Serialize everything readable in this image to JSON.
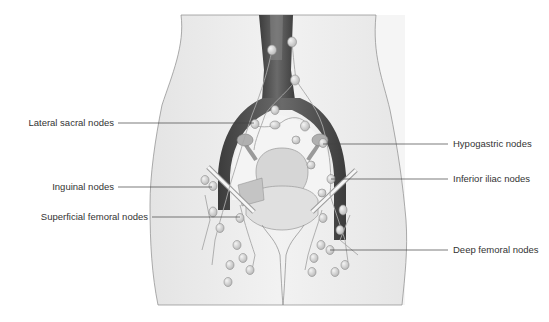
{
  "figure": {
    "labels_left": [
      {
        "id": "lateral-sacral",
        "text": "Lateral sacral nodes",
        "y": 123
      },
      {
        "id": "inguinal",
        "text": "Inguinal nodes",
        "y": 187
      },
      {
        "id": "superficial-femoral",
        "text": "Superficial femoral nodes",
        "y": 217
      }
    ],
    "labels_right": [
      {
        "id": "hypogastric",
        "text": "Hypogastric nodes",
        "y": 144
      },
      {
        "id": "inferior-iliac",
        "text": "Inferior iliac nodes",
        "y": 179
      },
      {
        "id": "deep-femoral",
        "text": "Deep femoral nodes",
        "y": 250
      }
    ],
    "colors": {
      "body_fill": "#ececec",
      "outline": "#8a8a8a",
      "vessel_dark": "#4a4a4a",
      "organ_fill": "#d8d8d8",
      "node_fill": "#cfcfcf",
      "leader_line": "#444444",
      "text": "#333333"
    }
  }
}
